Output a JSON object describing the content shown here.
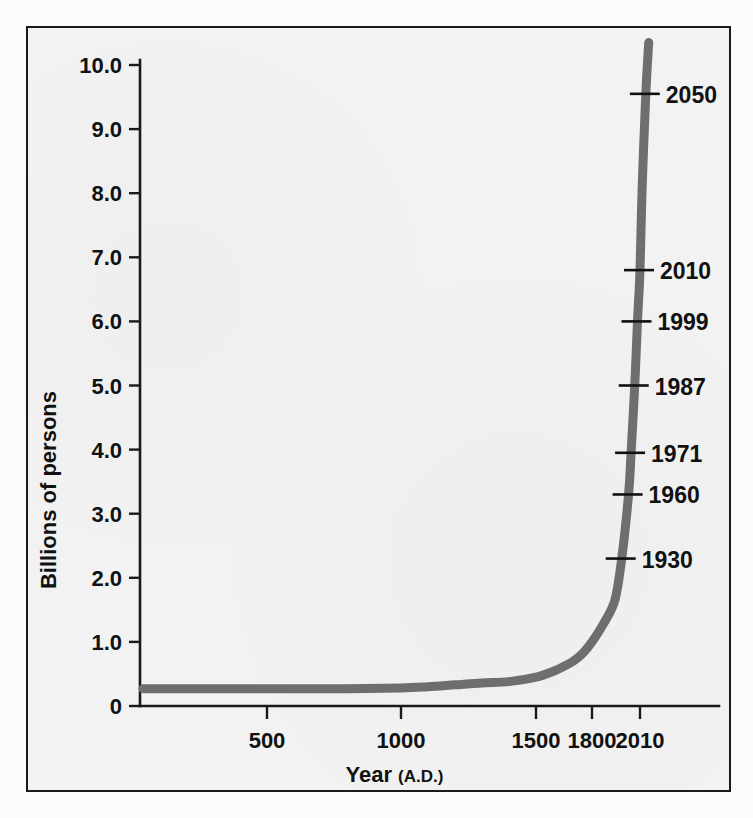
{
  "figure": {
    "background_color": "#f2f2f2",
    "border_color": "#1a1a1a",
    "curve_color": "#6e6e6e"
  },
  "chart_data": {
    "type": "line",
    "title": "",
    "subtitle": "",
    "xlabel": "Year",
    "xlabel_suffix": "(A.D.)",
    "ylabel": "Billions of persons",
    "xlim": [
      1,
      2120
    ],
    "ylim": [
      0,
      10.4
    ],
    "grid": false,
    "legend": null,
    "x_ticks": [
      {
        "value": 500,
        "label": "500"
      },
      {
        "value": 1000,
        "label": "1000"
      },
      {
        "value": 1500,
        "label": "1500"
      },
      {
        "value": 1800,
        "label": "1800"
      },
      {
        "value": 2010,
        "label": "2010"
      }
    ],
    "y_ticks": [
      {
        "value": 0,
        "label": "0"
      },
      {
        "value": 1.0,
        "label": "1.0"
      },
      {
        "value": 2.0,
        "label": "2.0"
      },
      {
        "value": 3.0,
        "label": "3.0"
      },
      {
        "value": 4.0,
        "label": "4.0"
      },
      {
        "value": 5.0,
        "label": "5.0"
      },
      {
        "value": 6.0,
        "label": "6.0"
      },
      {
        "value": 7.0,
        "label": "7.0"
      },
      {
        "value": 8.0,
        "label": "8.0"
      },
      {
        "value": 9.0,
        "label": "9.0"
      },
      {
        "value": 10.0,
        "label": "10.0"
      }
    ],
    "series": [
      {
        "name": "World population",
        "x": [
          1,
          200,
          400,
          600,
          800,
          1000,
          1100,
          1200,
          1300,
          1400,
          1500,
          1600,
          1650,
          1700,
          1750,
          1800,
          1850,
          1900,
          1930,
          1960,
          1971,
          1987,
          1999,
          2010,
          2025,
          2050,
          2070
        ],
        "y": [
          0.27,
          0.27,
          0.27,
          0.27,
          0.27,
          0.28,
          0.3,
          0.33,
          0.36,
          0.38,
          0.45,
          0.55,
          0.62,
          0.7,
          0.82,
          1.0,
          1.28,
          1.65,
          2.3,
          3.3,
          3.95,
          5.0,
          6.0,
          6.8,
          8.1,
          9.55,
          10.35
        ]
      }
    ],
    "annotations": [
      {
        "label": "2050",
        "year": 2050,
        "value": 9.55
      },
      {
        "label": "2010",
        "year": 2010,
        "value": 6.8
      },
      {
        "label": "1999",
        "year": 1999,
        "value": 6.0
      },
      {
        "label": "1987",
        "year": 1987,
        "value": 5.0
      },
      {
        "label": "1971",
        "year": 1971,
        "value": 3.95
      },
      {
        "label": "1960",
        "year": 1960,
        "value": 3.3
      },
      {
        "label": "1930",
        "year": 1930,
        "value": 2.3
      }
    ]
  }
}
